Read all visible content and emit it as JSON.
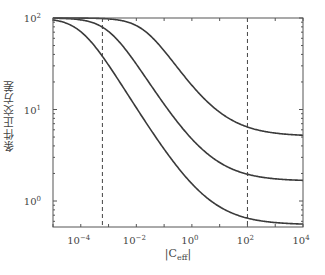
{
  "chart_data": {
    "type": "line",
    "title": "",
    "xlabel": "|C_eff|",
    "xlabel_main": "|C",
    "xlabel_sub": "eff",
    "xlabel_end": "|",
    "ylabel": "条件正交方差",
    "xscale": "log",
    "yscale": "log",
    "xlim": [
      1e-05,
      10000.0
    ],
    "ylim": [
      0.52,
      100
    ],
    "x_ticks": [
      -4,
      -2,
      0,
      2,
      4
    ],
    "x_tick_labels": [
      "10^-4",
      "10^-2",
      "10^0",
      "10^2",
      "10^4"
    ],
    "y_ticks": [
      0,
      1,
      2
    ],
    "y_tick_labels": [
      "10^0",
      "10^1",
      "10^2"
    ],
    "grid": false,
    "legend": null,
    "vertical_dashed_lines": [
      0.0006,
      100
    ],
    "series": [
      {
        "name": "curve-1",
        "floor": 0.55,
        "x0": 0.0001,
        "exponent": 0.5,
        "points": [
          [
            1e-05,
            97
          ],
          [
            0.0001,
            71
          ],
          [
            0.001,
            30.6
          ],
          [
            0.01,
            10.5
          ],
          [
            1.0,
            1.55
          ],
          [
            100.0,
            0.65
          ],
          [
            10000.0,
            0.55
          ]
        ]
      },
      {
        "name": "curve-2",
        "floor": 1.65,
        "x0": 0.001,
        "exponent": 0.5,
        "points": [
          [
            1e-05,
            100
          ],
          [
            0.0001,
            97
          ],
          [
            0.001,
            72
          ],
          [
            0.01,
            31.8
          ],
          [
            1.0,
            4.8
          ],
          [
            100.0,
            1.97
          ],
          [
            10000.0,
            1.66
          ]
        ]
      },
      {
        "name": "curve-3",
        "floor": 5.1,
        "x0": 0.02,
        "exponent": 0.5,
        "points": [
          [
            1e-05,
            100
          ],
          [
            0.001,
            100
          ],
          [
            0.01,
            86
          ],
          [
            0.1,
            45
          ],
          [
            1.0,
            18.9
          ],
          [
            100.0,
            6.5
          ],
          [
            10000.0,
            5.15
          ]
        ]
      }
    ],
    "colors": {
      "line": "#3a3a3a",
      "axis": "#555555",
      "dash": "#444444"
    }
  }
}
